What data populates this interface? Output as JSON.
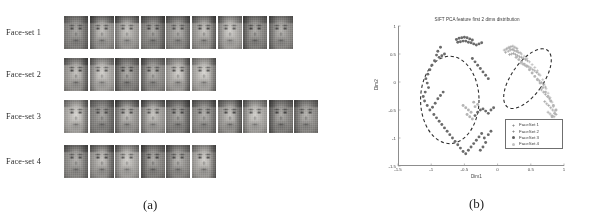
{
  "figure": {
    "panel_a": {
      "caption": "(a)",
      "rows": [
        {
          "label": "Face-set 1",
          "count": 9
        },
        {
          "label": "Face-set 2",
          "count": 6
        },
        {
          "label": "Face-set 3",
          "count": 10
        },
        {
          "label": "Face-set 4",
          "count": 6
        }
      ]
    },
    "panel_b": {
      "caption": "(b)",
      "legend_items": [
        {
          "marker": "+",
          "label": "FaceSet 1"
        },
        {
          "marker": "+",
          "label": "FaceSet 2"
        },
        {
          "marker": "dot",
          "label": "FaceSet 3"
        },
        {
          "marker": "dot",
          "label": "FaceSet 4"
        }
      ]
    }
  },
  "chart_data": {
    "type": "scatter",
    "title": "SIFT PCA feature first 2 dims distribution",
    "xlabel": "Dim1",
    "ylabel": "Dim2",
    "xlim": [
      -1.5,
      1.0
    ],
    "ylim": [
      -1.5,
      1.0
    ],
    "xticks": [
      -1.5,
      -1,
      -0.5,
      0,
      0.5,
      1
    ],
    "xticklabels": [
      "-1.5",
      "-1",
      "-0.5",
      "0",
      "0.5",
      "1"
    ],
    "yticks": [
      -1.5,
      -1,
      -0.5,
      0,
      0.5,
      1
    ],
    "yticklabels": [
      "-1.5",
      "-1",
      "-0.5",
      "0",
      "0.5",
      "1"
    ],
    "grid": false,
    "legend_position": "lower right",
    "annotations": [
      {
        "type": "ellipse",
        "style": "dashed",
        "cx": -0.72,
        "cy": -0.32,
        "rx": 0.44,
        "ry": 0.78,
        "rotation": 0,
        "label": "left cluster group"
      },
      {
        "type": "ellipse",
        "style": "dashed",
        "cx": 0.45,
        "cy": 0.06,
        "rx": 0.24,
        "ry": 0.62,
        "rotation": 35,
        "label": "right cluster group"
      }
    ],
    "series": [
      {
        "name": "FaceSet 1",
        "marker": "+",
        "color": "#8c8c8c",
        "points": [
          [
            0.1,
            0.57
          ],
          [
            0.14,
            0.6
          ],
          [
            0.17,
            0.62
          ],
          [
            0.2,
            0.63
          ],
          [
            0.23,
            0.64
          ],
          [
            0.26,
            0.62
          ],
          [
            0.29,
            0.6
          ],
          [
            0.12,
            0.53
          ],
          [
            0.16,
            0.55
          ],
          [
            0.19,
            0.57
          ],
          [
            0.22,
            0.58
          ],
          [
            0.25,
            0.56
          ],
          [
            0.28,
            0.55
          ],
          [
            0.31,
            0.53
          ],
          [
            0.34,
            0.52
          ],
          [
            0.18,
            0.49
          ],
          [
            0.21,
            0.5
          ],
          [
            0.24,
            0.51
          ],
          [
            0.27,
            0.49
          ],
          [
            0.3,
            0.47
          ],
          [
            0.33,
            0.45
          ],
          [
            0.36,
            0.44
          ],
          [
            0.39,
            0.42
          ],
          [
            0.42,
            0.4
          ],
          [
            0.45,
            0.38
          ],
          [
            0.35,
            0.34
          ],
          [
            0.38,
            0.32
          ],
          [
            0.41,
            0.3
          ],
          [
            0.44,
            0.29
          ],
          [
            0.47,
            0.27
          ],
          [
            0.5,
            0.25
          ],
          [
            0.53,
            0.22
          ],
          [
            0.56,
            0.2
          ],
          [
            0.59,
            0.17
          ],
          [
            0.62,
            0.14
          ],
          [
            0.6,
            0.05
          ],
          [
            0.63,
            0.02
          ],
          [
            0.66,
            -0.01
          ],
          [
            0.69,
            -0.05
          ],
          [
            0.72,
            -0.09
          ],
          [
            0.66,
            -0.14
          ],
          [
            0.69,
            -0.18
          ],
          [
            0.72,
            -0.22
          ],
          [
            0.75,
            -0.26
          ],
          [
            0.78,
            -0.3
          ],
          [
            0.71,
            -0.35
          ],
          [
            0.74,
            -0.39
          ],
          [
            0.77,
            -0.42
          ],
          [
            0.8,
            -0.46
          ],
          [
            0.83,
            -0.5
          ],
          [
            0.76,
            -0.54
          ],
          [
            0.79,
            -0.57
          ],
          [
            0.82,
            -0.6
          ],
          [
            0.85,
            -0.62
          ],
          [
            0.88,
            -0.58
          ]
        ]
      },
      {
        "name": "FaceSet 2",
        "marker": "+",
        "color": "#a8a8a8",
        "points": [
          [
            0.13,
            0.58
          ],
          [
            0.18,
            0.6
          ],
          [
            0.24,
            0.59
          ],
          [
            0.3,
            0.56
          ],
          [
            0.36,
            0.5
          ],
          [
            0.4,
            0.46
          ],
          [
            0.44,
            0.42
          ],
          [
            0.48,
            0.36
          ],
          [
            0.52,
            0.31
          ],
          [
            0.56,
            0.26
          ],
          [
            0.6,
            0.2
          ],
          [
            0.64,
            0.12
          ],
          [
            0.68,
            0.04
          ],
          [
            0.7,
            -0.04
          ],
          [
            0.73,
            -0.12
          ],
          [
            0.76,
            -0.2
          ],
          [
            0.79,
            -0.28
          ],
          [
            0.82,
            -0.36
          ],
          [
            0.84,
            -0.44
          ],
          [
            0.86,
            -0.52
          ]
        ]
      },
      {
        "name": "FaceSet 3",
        "marker": "dot",
        "color": "#6b6b6b",
        "points": [
          [
            -0.62,
            0.76
          ],
          [
            -0.58,
            0.78
          ],
          [
            -0.54,
            0.79
          ],
          [
            -0.5,
            0.8
          ],
          [
            -0.46,
            0.79
          ],
          [
            -0.42,
            0.77
          ],
          [
            -0.38,
            0.75
          ],
          [
            -0.6,
            0.71
          ],
          [
            -0.56,
            0.72
          ],
          [
            -0.52,
            0.73
          ],
          [
            -0.48,
            0.73
          ],
          [
            -0.44,
            0.71
          ],
          [
            -0.4,
            0.7
          ],
          [
            -0.36,
            0.68
          ],
          [
            -0.32,
            0.66
          ],
          [
            -0.28,
            0.68
          ],
          [
            -0.24,
            0.7
          ],
          [
            -0.86,
            0.62
          ],
          [
            -0.9,
            0.55
          ],
          [
            -0.92,
            0.48
          ],
          [
            -0.88,
            0.44
          ],
          [
            -0.84,
            0.47
          ],
          [
            -0.8,
            0.5
          ],
          [
            -0.95,
            0.38
          ],
          [
            -0.99,
            0.3
          ],
          [
            -1.02,
            0.22
          ],
          [
            -1.05,
            0.14
          ],
          [
            -1.08,
            0.06
          ],
          [
            -1.06,
            -0.02
          ],
          [
            -1.04,
            -0.1
          ],
          [
            -1.09,
            -0.18
          ],
          [
            -1.12,
            -0.26
          ],
          [
            -1.1,
            -0.34
          ],
          [
            -1.06,
            -0.42
          ],
          [
            -1.02,
            -0.5
          ],
          [
            -0.98,
            -0.45
          ],
          [
            -0.94,
            -0.38
          ],
          [
            -0.9,
            -0.3
          ],
          [
            -0.86,
            -0.24
          ],
          [
            -0.82,
            -0.18
          ],
          [
            -0.96,
            -0.58
          ],
          [
            -0.92,
            -0.64
          ],
          [
            -0.88,
            -0.7
          ],
          [
            -0.84,
            -0.76
          ],
          [
            -0.8,
            -0.82
          ],
          [
            -0.76,
            -0.88
          ],
          [
            -0.72,
            -0.94
          ],
          [
            -0.68,
            -1.0
          ],
          [
            -0.64,
            -1.06
          ],
          [
            -0.6,
            -1.12
          ],
          [
            -0.56,
            -1.18
          ],
          [
            -0.52,
            -1.24
          ],
          [
            -0.48,
            -1.28
          ],
          [
            -0.44,
            -1.22
          ],
          [
            -0.4,
            -1.16
          ],
          [
            -0.36,
            -1.1
          ],
          [
            -0.32,
            -1.04
          ],
          [
            -0.28,
            -0.98
          ],
          [
            -0.24,
            -0.92
          ],
          [
            -0.2,
            -1.0
          ],
          [
            -0.18,
            -1.08
          ],
          [
            -0.22,
            -1.16
          ],
          [
            -0.26,
            -1.22
          ],
          [
            -0.14,
            -0.94
          ],
          [
            -0.1,
            -0.88
          ],
          [
            -0.34,
            -0.6
          ],
          [
            -0.3,
            -0.54
          ],
          [
            -0.26,
            -0.5
          ],
          [
            -0.22,
            -0.48
          ],
          [
            -0.18,
            -0.52
          ],
          [
            -0.14,
            -0.56
          ],
          [
            -0.1,
            -0.5
          ],
          [
            -0.06,
            -0.46
          ],
          [
            -0.38,
            0.42
          ],
          [
            -0.34,
            0.36
          ],
          [
            -0.3,
            0.3
          ],
          [
            -0.26,
            0.24
          ],
          [
            -0.22,
            0.18
          ],
          [
            -0.18,
            0.12
          ],
          [
            -0.14,
            0.06
          ]
        ]
      },
      {
        "name": "FaceSet 4",
        "marker": "dot",
        "color": "#b5b5b5",
        "points": [
          [
            -0.52,
            -0.42
          ],
          [
            -0.48,
            -0.46
          ],
          [
            -0.44,
            -0.5
          ],
          [
            -0.4,
            -0.54
          ],
          [
            -0.46,
            -0.58
          ],
          [
            -0.42,
            -0.62
          ],
          [
            -0.38,
            -0.66
          ],
          [
            -0.34,
            -0.44
          ],
          [
            -0.3,
            -0.4
          ],
          [
            -0.36,
            -0.36
          ],
          [
            0.28,
            0.44
          ],
          [
            0.32,
            0.4
          ],
          [
            0.36,
            0.36
          ],
          [
            0.4,
            0.32
          ],
          [
            0.44,
            0.28
          ],
          [
            0.48,
            0.22
          ],
          [
            0.52,
            0.16
          ],
          [
            0.56,
            0.1
          ],
          [
            0.6,
            0.04
          ],
          [
            0.64,
            -0.02
          ],
          [
            0.68,
            -0.1
          ],
          [
            0.72,
            -0.18
          ],
          [
            0.76,
            -0.26
          ],
          [
            0.8,
            -0.34
          ],
          [
            0.84,
            -0.42
          ],
          [
            0.88,
            -0.5
          ],
          [
            0.86,
            -0.56
          ],
          [
            0.82,
            -0.62
          ]
        ]
      }
    ]
  }
}
